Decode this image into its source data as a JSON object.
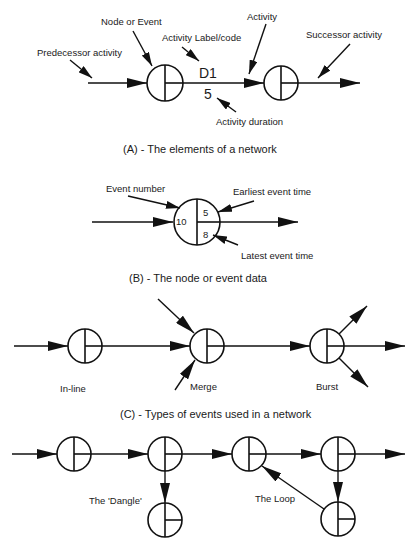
{
  "sections": {
    "a": {
      "caption": "(A) - The elements of a network",
      "labels": {
        "predecessor": "Predecessor activity",
        "node": "Node or Event",
        "activity_label": "Activity Label/code",
        "activity": "Activity",
        "successor": "Successor activity",
        "duration": "Activity duration"
      },
      "activity_code": "D1",
      "activity_duration": "5"
    },
    "b": {
      "caption": "(B) - The node or event data",
      "labels": {
        "event_number": "Event number",
        "earliest": "Earliest event time",
        "latest": "Latest event time"
      },
      "event_number": "10",
      "earliest_time": "5",
      "latest_time": "8"
    },
    "c": {
      "caption": "(C) - Types of events used in a network",
      "labels": {
        "inline": "In-line",
        "merge": "Merge",
        "burst": "Burst"
      }
    },
    "d": {
      "labels": {
        "dangle": "The 'Dangle'",
        "loop": "The Loop"
      }
    }
  },
  "colors": {
    "ink": "#111111",
    "background": "#ffffff"
  }
}
